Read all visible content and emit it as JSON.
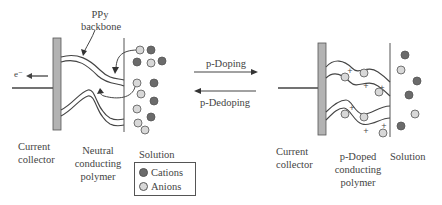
{
  "diagram": {
    "left_panel": {
      "labels": {
        "ppy_line1": "PPy",
        "ppy_line2": "backbone",
        "electron": "e⁻",
        "current_collector_line1": "Current",
        "current_collector_line2": "collector",
        "polymer_line1": "Neutral",
        "polymer_line2": "conducting",
        "polymer_line3": "polymer",
        "solution": "Solution"
      }
    },
    "right_panel": {
      "labels": {
        "current_collector_line1": "Current",
        "current_collector_line2": "collector",
        "polymer_line1": "p-Doped",
        "polymer_line2": "conducting",
        "polymer_line3": "polymer",
        "solution": "Solution"
      }
    },
    "arrows": {
      "forward": "p-Doping",
      "reverse": "p-Dedoping"
    },
    "legend": {
      "cations": "Cations",
      "anions": "Anions"
    },
    "colors": {
      "cation": "#6b6b6b",
      "anion": "#d8d8d8",
      "collector": "#b3b3b3",
      "line": "#444444"
    }
  }
}
